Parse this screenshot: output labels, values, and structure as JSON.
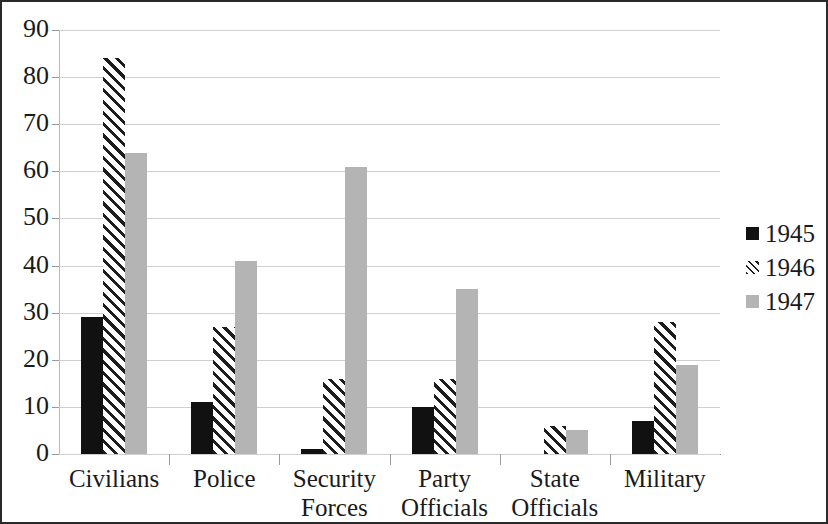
{
  "chart_data": {
    "type": "bar",
    "title": "",
    "subtitle": "",
    "xlabel": "",
    "ylabel": "",
    "ylim": [
      0,
      90
    ],
    "ytick_step": 10,
    "yticks": [
      0,
      10,
      20,
      30,
      40,
      50,
      60,
      70,
      80,
      90
    ],
    "ytick_labels": [
      "0",
      "10",
      "20",
      "30",
      "40",
      "50",
      "60",
      "70",
      "80",
      "90"
    ],
    "grid": true,
    "grid_axis": "y",
    "legend_position": "right",
    "categories": [
      "Civilians",
      "Security Forces",
      "Police",
      "Party Officials",
      "State Officials",
      "Military"
    ],
    "category_display": [
      [
        "Civilians"
      ],
      [
        "Police"
      ],
      [
        "Security",
        "Forces"
      ],
      [
        "Party",
        "Officials"
      ],
      [
        "State",
        "Officials"
      ],
      [
        "Military"
      ]
    ],
    "category_order": [
      "Civilians",
      "Police",
      "Security Forces",
      "Party Officials",
      "State Officials",
      "Military"
    ],
    "series": [
      {
        "name": "1945",
        "color": "#111111",
        "pattern": "solid",
        "values": [
          29,
          11,
          1,
          10,
          0,
          7
        ]
      },
      {
        "name": "1946",
        "color": "#1d1d1d",
        "pattern": "diagonal-hatch",
        "values": [
          84,
          27,
          16,
          16,
          6,
          28
        ]
      },
      {
        "name": "1947",
        "color": "#b4b4b4",
        "pattern": "solid",
        "values": [
          64,
          41,
          61,
          35,
          5,
          19
        ]
      }
    ]
  },
  "legend": {
    "entries": [
      {
        "label": "1945"
      },
      {
        "label": "1946"
      },
      {
        "label": "1947"
      }
    ]
  },
  "colors": {
    "series_1945": "#111111",
    "series_1946": "#1d1d1d",
    "series_1947": "#b4b4b4",
    "gridline": "#cfcfcf",
    "axis": "#8d8d8d",
    "border": "#2a2a2a",
    "text": "#1a1a1a",
    "background": "#ffffff"
  }
}
